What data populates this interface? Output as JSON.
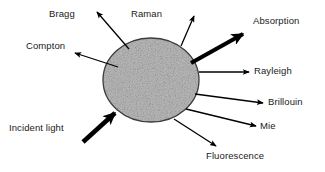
{
  "diagram": {
    "background_color": "#ffffff",
    "text_color": "#1a1a1a",
    "arrow_color": "#000000",
    "particle": {
      "name": "scattering-particle",
      "shape": "ellipse",
      "fill_color": "#a8a8a8",
      "stroke_color": "#3a3a3a",
      "texture": "speckled-grain",
      "center_x": 151,
      "center_y": 80,
      "radius_x": 48,
      "radius_y": 42
    },
    "labels": {
      "bragg": "Bragg",
      "raman": "Raman",
      "absorption": "Absorption",
      "compton": "Compton",
      "rayleigh": "Rayleigh",
      "brillouin": "Brillouin",
      "mie": "Mie",
      "incident_light": "Incident light",
      "fluorescence": "Fluorescence"
    },
    "arrows": [
      {
        "name": "incident-light-arrow",
        "label": "Incident light",
        "direction": "inbound",
        "weight": "thick",
        "from_x": 83,
        "from_y": 142,
        "to_x": 119,
        "to_y": 110
      },
      {
        "name": "compton-arrow",
        "label": "Compton",
        "direction": "outbound",
        "weight": "thin",
        "from_x": 118,
        "from_y": 67,
        "to_x": 75,
        "to_y": 53
      },
      {
        "name": "bragg-arrow",
        "label": "Bragg",
        "direction": "outbound",
        "weight": "thin",
        "from_x": 129,
        "from_y": 49,
        "to_x": 97,
        "to_y": 12
      },
      {
        "name": "raman-arrow",
        "label": "Raman",
        "direction": "outbound",
        "weight": "thin",
        "from_x": 181,
        "from_y": 46,
        "to_x": 194,
        "to_y": 16
      },
      {
        "name": "absorption-arrow",
        "label": "Absorption",
        "direction": "outbound",
        "weight": "thick",
        "from_x": 191,
        "from_y": 63,
        "to_x": 247,
        "to_y": 31
      },
      {
        "name": "rayleigh-arrow",
        "label": "Rayleigh",
        "direction": "outbound",
        "weight": "thin",
        "from_x": 199,
        "from_y": 72,
        "to_x": 249,
        "to_y": 72
      },
      {
        "name": "brillouin-arrow",
        "label": "Brillouin",
        "direction": "outbound",
        "weight": "thin",
        "from_x": 195,
        "from_y": 94,
        "to_x": 263,
        "to_y": 103
      },
      {
        "name": "mie-arrow",
        "label": "Mie",
        "direction": "outbound",
        "weight": "thin",
        "from_x": 186,
        "from_y": 109,
        "to_x": 256,
        "to_y": 126
      },
      {
        "name": "fluorescence-arrow",
        "label": "Fluorescence",
        "direction": "outbound",
        "weight": "thin",
        "from_x": 174,
        "from_y": 119,
        "to_x": 216,
        "to_y": 146
      }
    ]
  }
}
